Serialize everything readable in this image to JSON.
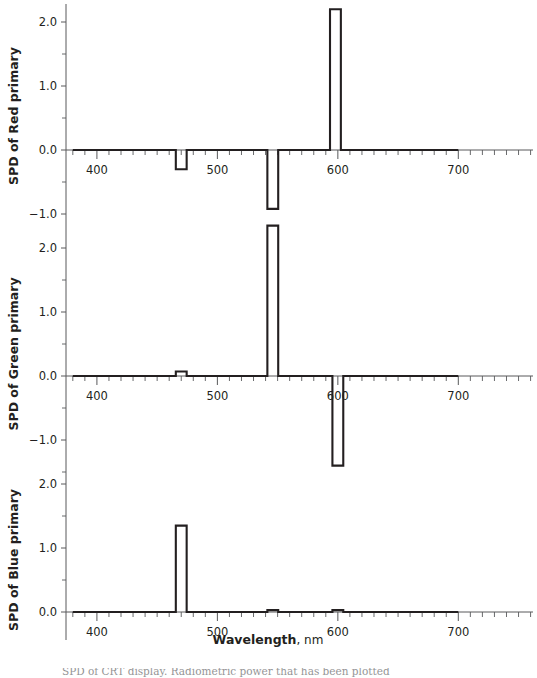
{
  "figure": {
    "xlabel_bold": "Wavelength",
    "xlabel_rest": ", nm",
    "caption_partial": "SPD of CRT display. Radiometric power that has been plotted"
  },
  "axes": {
    "x_ticks_major": [
      400,
      500,
      600,
      700
    ],
    "x_tick_labels": [
      "400",
      "500",
      "600",
      "700"
    ],
    "x_minor_step": 10,
    "x_axis_min": 376,
    "x_axis_max": 762,
    "x_data_min": 380,
    "x_data_max": 700,
    "y_ticks_major": [
      2.0,
      1.0,
      0.0,
      -1.0
    ],
    "y_tick_labels": [
      "2.0",
      "1.0",
      "0.0",
      "−1.0"
    ],
    "y_minor_ticks": [
      2.5,
      1.5,
      0.5,
      -0.5,
      -1.5
    ]
  },
  "chart_data": {
    "type": "line",
    "title": "",
    "xlabel": "Wavelength, nm",
    "subplots": [
      {
        "id": "red",
        "ylabel": "SPD of Red primary",
        "ylim": [
          -1.45,
          2.45
        ],
        "y_visible_top": 2.45,
        "y_visible_bottom": -1.45,
        "baseline": 0.0,
        "spikes": [
          {
            "center": 470,
            "width": 9,
            "value": -0.3
          },
          {
            "center": 546,
            "width": 9,
            "value": -0.92
          },
          {
            "center": 598,
            "width": 9,
            "value": 2.2
          }
        ]
      },
      {
        "id": "green",
        "ylabel": "SPD of Green primary",
        "ylim": [
          -1.6,
          2.5
        ],
        "y_visible_top": 2.5,
        "y_visible_bottom": -1.6,
        "baseline": 0.0,
        "spikes": [
          {
            "center": 470,
            "width": 9,
            "value": 0.07
          },
          {
            "center": 546,
            "width": 9,
            "value": 2.35
          },
          {
            "center": 600,
            "width": 9,
            "value": -1.4
          }
        ]
      },
      {
        "id": "blue",
        "ylabel": "SPD of Blue primary",
        "ylim": [
          -0.45,
          2.3
        ],
        "y_visible_top": 2.3,
        "y_visible_bottom": -0.45,
        "baseline": 0.0,
        "spikes": [
          {
            "center": 470,
            "width": 9,
            "value": 1.35
          },
          {
            "center": 546,
            "width": 9,
            "value": 0.03
          },
          {
            "center": 600,
            "width": 9,
            "value": 0.03
          }
        ]
      }
    ],
    "grid": false,
    "legend": "none"
  },
  "colors": {
    "ink": "#231f20",
    "axis": "#58595b",
    "background": "#ffffff"
  }
}
